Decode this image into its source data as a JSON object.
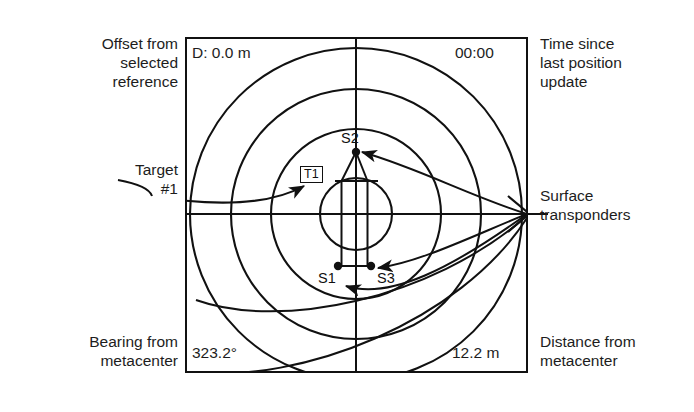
{
  "figure": {
    "kind": "transponder-navigation-display",
    "frame": {
      "x": 186,
      "y": 38,
      "width": 341,
      "height": 334
    },
    "center": {
      "x": 356,
      "y": 214
    },
    "range_ring_radii": [
      36,
      85,
      125,
      166
    ]
  },
  "readouts": {
    "depth": "D: 0.0 m",
    "time_since_update": "00:00",
    "bearing": "323.2°",
    "distance": "12.2 m"
  },
  "annotations": {
    "offset": "Offset from\nselected\nreference",
    "target": "Target\n#1",
    "bearing": "Bearing from\nmetacenter",
    "time": "Time since\nlast position\nupdate",
    "surface": "Surface\ntransponders",
    "distance": "Distance from\nmetacenter"
  },
  "markers": [
    {
      "id": "S2",
      "label": "S2",
      "x": 356,
      "y": 152
    },
    {
      "id": "S1",
      "label": "S1",
      "x": 338,
      "y": 266
    },
    {
      "id": "S3",
      "label": "S3",
      "x": 371,
      "y": 266
    },
    {
      "id": "T1",
      "label": "T1",
      "x": 313,
      "y": 174
    }
  ],
  "colors": {
    "stroke": "#111111",
    "background": "#ffffff",
    "text": "#1d1d1d"
  }
}
